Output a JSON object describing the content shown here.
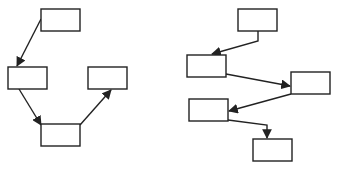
{
  "colors": {
    "stroke": "#222222",
    "background": "#ffffff",
    "box_fill": "#ffffff"
  },
  "diagrams": [
    {
      "id": "left",
      "nodes": [
        {
          "id": "A",
          "label": "",
          "x": 41,
          "y": 9,
          "w": 39,
          "h": 22
        },
        {
          "id": "B",
          "label": "",
          "x": 8,
          "y": 67,
          "w": 39,
          "h": 22
        },
        {
          "id": "C",
          "label": "",
          "x": 88,
          "y": 67,
          "w": 39,
          "h": 22
        },
        {
          "id": "D",
          "label": "",
          "x": 41,
          "y": 124,
          "w": 39,
          "h": 22
        }
      ],
      "edges": [
        {
          "from": "A",
          "to": "B",
          "points": [
            [
              41,
              19
            ],
            [
              17,
              66
            ]
          ]
        },
        {
          "from": "B",
          "to": "D",
          "points": [
            [
              19,
              89
            ],
            [
              41,
              125
            ]
          ]
        },
        {
          "from": "D",
          "to": "C",
          "points": [
            [
              80,
              125
            ],
            [
              111,
              90
            ]
          ]
        }
      ]
    },
    {
      "id": "right",
      "nodes": [
        {
          "id": "E",
          "label": "",
          "x": 238,
          "y": 9,
          "w": 39,
          "h": 22
        },
        {
          "id": "F",
          "label": "",
          "x": 187,
          "y": 55,
          "w": 39,
          "h": 22
        },
        {
          "id": "G",
          "label": "",
          "x": 291,
          "y": 72,
          "w": 39,
          "h": 22
        },
        {
          "id": "H",
          "label": "",
          "x": 189,
          "y": 99,
          "w": 39,
          "h": 22
        },
        {
          "id": "I",
          "label": "",
          "x": 253,
          "y": 139,
          "w": 39,
          "h": 22
        }
      ],
      "edges": [
        {
          "from": "E",
          "to": "F",
          "points": [
            [
              258,
              31
            ],
            [
              258,
              41
            ],
            [
              212,
              54
            ]
          ]
        },
        {
          "from": "F",
          "to": "G",
          "points": [
            [
              226,
              74
            ],
            [
              290,
              86
            ]
          ]
        },
        {
          "from": "G",
          "to": "H",
          "points": [
            [
              291,
              94
            ],
            [
              229,
              111
            ]
          ]
        },
        {
          "from": "H",
          "to": "I",
          "points": [
            [
              228,
              120
            ],
            [
              267,
              125
            ],
            [
              267,
              138
            ]
          ]
        }
      ]
    }
  ]
}
